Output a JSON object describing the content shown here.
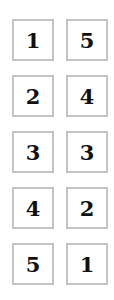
{
  "grid": {
    "rows": [
      {
        "left": "1",
        "right": "5"
      },
      {
        "left": "2",
        "right": "4"
      },
      {
        "left": "3",
        "right": "3"
      },
      {
        "left": "4",
        "right": "2"
      },
      {
        "left": "5",
        "right": "1"
      }
    ]
  },
  "colors": {
    "border": "#c4c4c4",
    "text": "#111111",
    "background": "#ffffff"
  }
}
